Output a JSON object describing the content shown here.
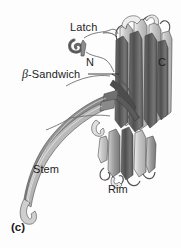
{
  "figure": {
    "panel_label": "(c)",
    "background_color": "#fdfdfd",
    "text_color": "#1d1d1d",
    "ribbon_dark_color": "#5c5c5c",
    "ribbon_mid_color": "#8f8f8f",
    "ribbon_light_color": "#c3c3c3",
    "ribbon_highlight_color": "#ffffff",
    "outline_color": "#4a4a4a"
  },
  "labels": {
    "latch": "Latch",
    "n_terminus": "N",
    "c_terminus": "C",
    "beta_symbol": "β",
    "sandwich_suffix": "-Sandwich",
    "stem": "Stem",
    "rim": "Rim"
  },
  "diagram": {
    "type": "protein-ribbon-diagram",
    "regions": [
      "Latch",
      "β-Sandwich",
      "Stem",
      "Rim"
    ],
    "termini": [
      "N",
      "C"
    ]
  }
}
